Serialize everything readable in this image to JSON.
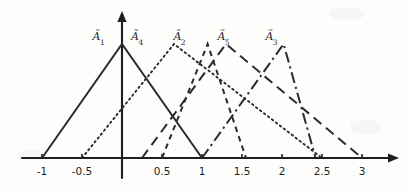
{
  "figure": {
    "background_color": "#fdfdfc",
    "line_color": "#2b2b2b",
    "axis_color": "#1f1f1f"
  },
  "axis": {
    "tick_labels": [
      "-1",
      "-0.5",
      "0.5",
      "1",
      "1.5",
      "2",
      "2.5",
      "3"
    ],
    "tick_values": [
      -1,
      -0.5,
      0.5,
      1,
      1.5,
      2,
      2.5,
      3
    ],
    "x_min": -1.35,
    "x_max": 3.35,
    "origin_label": "0",
    "has_y_axis": true,
    "has_arrows": true
  },
  "labels": [
    {
      "text": "A",
      "sub": "1",
      "name": "label-a1"
    },
    {
      "text": "A",
      "sub": "4",
      "name": "label-a4"
    },
    {
      "text": "A",
      "sub": "2",
      "name": "label-a2"
    },
    {
      "text": "A",
      "sub": "5",
      "name": "label-a5"
    },
    {
      "text": "A",
      "sub": "3",
      "name": "label-a3"
    }
  ],
  "chart_data": {
    "type": "line",
    "xlabel": "",
    "ylabel": "",
    "xlim": [
      -1.35,
      3.35
    ],
    "ylim": [
      0,
      1.1
    ],
    "grid": false,
    "legend": "inline-annotations",
    "x_ticks": [
      -1,
      -0.5,
      0.5,
      1,
      1.5,
      2,
      2.5,
      3
    ],
    "x_tick_labels": [
      "-1",
      "-0.5",
      "0.5",
      "1",
      "1.5",
      "2",
      "2.5",
      "3"
    ],
    "series": [
      {
        "name": "A1",
        "label": "Ã1",
        "linestyle": "solid",
        "triangle": {
          "left": -1,
          "peak": 0,
          "right": 1
        },
        "x": [
          -1,
          0,
          1
        ],
        "values": [
          0,
          1,
          0
        ],
        "label_x": -0.28,
        "label_y": 1.06
      },
      {
        "name": "A4",
        "label": "Ã4",
        "linestyle": "dotted",
        "triangle": {
          "left": -0.5,
          "peak": 0.65,
          "right": 2.5
        },
        "x": [
          -0.5,
          0.65,
          2.5
        ],
        "values": [
          0,
          1,
          0
        ],
        "label_x": 0.2,
        "label_y": 1.06
      },
      {
        "name": "A2",
        "label": "Ã2",
        "linestyle": "long-dash",
        "triangle": {
          "left": 0.25,
          "peak": 1.3,
          "right": 3
        },
        "x": [
          0.25,
          1.3,
          3
        ],
        "values": [
          0,
          1,
          0
        ],
        "label_x": 0.73,
        "label_y": 1.06
      },
      {
        "name": "A5",
        "label": "Ã5",
        "linestyle": "short-dash",
        "triangle": {
          "left": 0.5,
          "peak": 1.07,
          "right": 1.55
        },
        "x": [
          0.5,
          1.07,
          1.55
        ],
        "values": [
          0,
          1,
          0
        ],
        "label_x": 1.28,
        "label_y": 1.06
      },
      {
        "name": "A3",
        "label": "Ã3",
        "linestyle": "dash-dot",
        "triangle": {
          "left": 1,
          "peak": 2.02,
          "right": 2.42
        },
        "x": [
          1,
          2.02,
          2.42
        ],
        "values": [
          0,
          1,
          0
        ],
        "label_x": 1.88,
        "label_y": 1.06
      }
    ]
  }
}
